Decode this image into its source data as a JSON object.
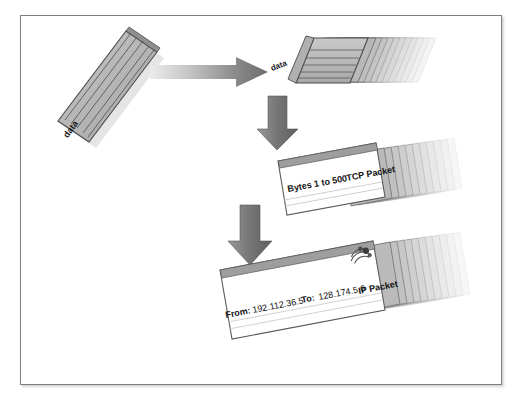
{
  "diagram": {
    "title": "Data encapsulation into TCP and IP packets",
    "background_color": "#ffffff",
    "frame_border_color": "#7d7d7d",
    "stages": [
      {
        "id": "source-data",
        "label": "data",
        "kind": "data-block",
        "description": "Original tilted striped data block on the left"
      },
      {
        "id": "segmented-data",
        "label": "data",
        "kind": "data-block-stack",
        "stack_count": 12,
        "description": "Data split into a fading stack of segments"
      },
      {
        "id": "tcp-packet",
        "kind": "packet-stack",
        "stack_count": 12,
        "fields": {
          "bytes": "Bytes 1 to 500",
          "type": "TCP Packet"
        }
      },
      {
        "id": "ip-packet",
        "kind": "packet-stack",
        "stack_count": 12,
        "stamp_icon": "postage-stamp-icon",
        "fields": {
          "from_label": "From:",
          "from_value": "192.112.36.5",
          "to_label": "To:",
          "to_value": "128.174.5.6",
          "type": "IP Packet"
        }
      }
    ],
    "arrows": [
      {
        "id": "arrow-data-to-segments",
        "direction": "right",
        "color": "#6e6e6e"
      },
      {
        "id": "arrow-segments-to-tcp",
        "direction": "down",
        "color": "#6e6e6e"
      },
      {
        "id": "arrow-tcp-to-ip",
        "direction": "down",
        "color": "#6e6e6e"
      }
    ],
    "colors": {
      "block_fill": "#b6b6b6",
      "block_stroke": "#4a4a4a",
      "card_fill": "#ffffff",
      "card_stroke": "#5a5a5a",
      "arrow_dark": "#6e6e6e",
      "arrow_light": "#e0e0e0",
      "text": "#111111"
    }
  }
}
